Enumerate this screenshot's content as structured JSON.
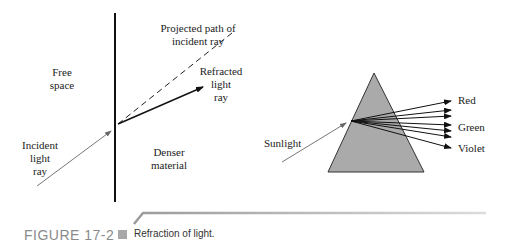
{
  "diagrams": {
    "refraction": {
      "labels": {
        "projected_path": "Projected path of\nincident ray",
        "free_space": "Free\nspace",
        "refracted_ray": "Refracted\nlight\nray",
        "incident_ray": "Incident\nlight\nray",
        "denser_material": "Denser\nmaterial"
      }
    },
    "prism": {
      "labels": {
        "sunlight": "Sunlight",
        "red": "Red",
        "green": "Green",
        "violet": "Violet"
      },
      "fill_color": "#aaaaaa"
    }
  },
  "caption": {
    "figure_number": "FIGURE 17-2",
    "text": "Refraction of light."
  }
}
